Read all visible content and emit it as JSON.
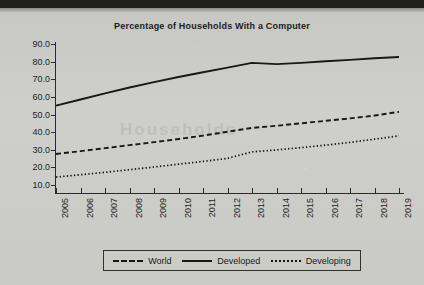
{
  "chart_data": {
    "type": "line",
    "title": "Percentage of Households With a Computer",
    "xlabel": "",
    "ylabel": "",
    "grid": false,
    "legend_position": "bottom",
    "ylim": [
      10.0,
      90.0
    ],
    "ytick_labels": [
      "90.0",
      "80.0",
      "70.0",
      "60.0",
      "50.0",
      "40.0",
      "30.0",
      "20.0",
      "10.0"
    ],
    "ytick_values": [
      90.0,
      80.0,
      70.0,
      60.0,
      50.0,
      40.0,
      30.0,
      20.0,
      10.0
    ],
    "categories": [
      "2005",
      "2006",
      "2007",
      "2008",
      "2009",
      "2010",
      "2011",
      "2012",
      "2013",
      "2014",
      "2015",
      "2016",
      "2017",
      "2018",
      "2019"
    ],
    "x": [
      2005,
      2006,
      2007,
      2008,
      2009,
      2010,
      2011,
      2012,
      2013,
      2014,
      2015,
      2016,
      2017,
      2018,
      2019
    ],
    "series": [
      {
        "name": "World",
        "style": "dashed",
        "color": "#18181a",
        "values": [
          27.6,
          29.2,
          30.9,
          32.6,
          34.3,
          36.1,
          38.0,
          40.2,
          42.4,
          43.6,
          45.0,
          46.4,
          47.8,
          49.4,
          51.5
        ]
      },
      {
        "name": "Developed",
        "style": "solid",
        "color": "#18181a",
        "values": [
          55.0,
          58.5,
          62.0,
          65.3,
          68.4,
          71.3,
          74.0,
          76.6,
          79.3,
          78.6,
          79.3,
          80.2,
          81.0,
          81.9,
          82.6
        ]
      },
      {
        "name": "Developing",
        "style": "dotted",
        "color": "#18181a",
        "values": [
          14.5,
          15.8,
          17.2,
          18.7,
          20.2,
          21.8,
          23.4,
          25.1,
          28.8,
          29.9,
          31.2,
          32.6,
          34.2,
          36.0,
          37.9
        ]
      }
    ]
  },
  "legend": {
    "items": [
      {
        "label": "World",
        "style": "dashed"
      },
      {
        "label": "Developed",
        "style": "solid"
      },
      {
        "label": "Developing",
        "style": "dotted"
      }
    ]
  },
  "bleed_text": "Households"
}
